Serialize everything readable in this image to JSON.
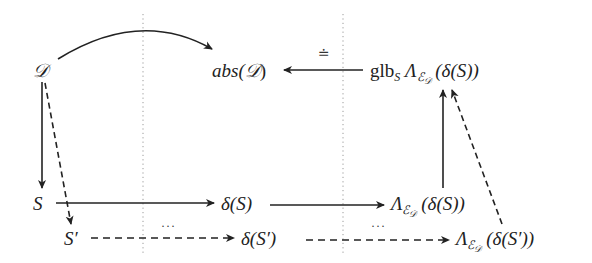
{
  "diagram": {
    "type": "commutative-diagram",
    "nodes": {
      "D": {
        "text": "𝒟",
        "x": 33,
        "y": 64
      },
      "absD": {
        "prefix": "abs(",
        "mid": "𝒟",
        "suffix": ")",
        "x": 213,
        "y": 64
      },
      "glb": {
        "glb": "glb",
        "glb_sub": "S",
        "lambda": "Λ",
        "e_sub": "ℰ",
        "d_sub": "𝒟",
        "arg": " (δ(S))",
        "x": 370,
        "y": 64
      },
      "S": {
        "text": "S",
        "x": 35,
        "y": 193
      },
      "deltaS": {
        "text": "δ(S)",
        "x": 222,
        "y": 193
      },
      "lamS": {
        "lambda": "Λ",
        "e_sub": "ℰ",
        "d_sub": "𝒟",
        "arg": " (δ(S))",
        "x": 391,
        "y": 193
      },
      "Sp": {
        "text": "S′",
        "x": 64,
        "y": 230
      },
      "deltaSp": {
        "text": "δ(S′)",
        "x": 241,
        "y": 230
      },
      "lamSp": {
        "lambda": "Λ",
        "e_sub": "ℰ",
        "d_sub": "𝒟",
        "arg": " (δ(S′))",
        "x": 456,
        "y": 230
      }
    },
    "edge_labels": {
      "glb_to_abs": "≐",
      "deltaSp_dots_left": "···",
      "deltaSp_dots_right": "···"
    },
    "edges": [
      {
        "from": "D",
        "to": "absD",
        "style": "solid",
        "shape": "curved"
      },
      {
        "from": "glb",
        "to": "absD",
        "style": "solid",
        "label": "≐"
      },
      {
        "from": "D",
        "to": "S",
        "style": "solid"
      },
      {
        "from": "D",
        "to": "Sp",
        "style": "dashed"
      },
      {
        "from": "S",
        "to": "deltaS",
        "style": "solid"
      },
      {
        "from": "deltaS",
        "to": "lamS",
        "style": "solid"
      },
      {
        "from": "lamS",
        "to": "glb",
        "style": "solid"
      },
      {
        "from": "Sp",
        "to": "deltaSp",
        "style": "dashed",
        "label": "···"
      },
      {
        "from": "deltaSp",
        "to": "lamSp",
        "style": "dashed",
        "label": "···"
      },
      {
        "from": "lamSp",
        "to": "glb",
        "style": "dashed"
      }
    ],
    "separators": [
      {
        "x": 143,
        "style": "dotted"
      },
      {
        "x": 343,
        "style": "dotted"
      }
    ],
    "colors": {
      "stroke": "#222222",
      "separator": "#9a9a9a",
      "background": "#ffffff"
    }
  }
}
